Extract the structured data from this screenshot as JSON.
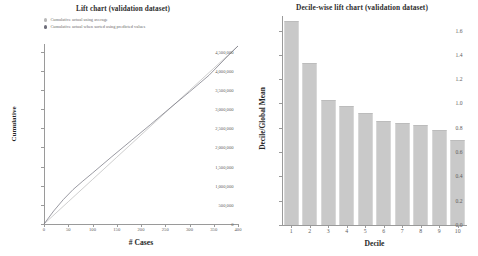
{
  "lift": {
    "title": "Lift chart (validation dataset)",
    "legend": [
      {
        "label": "Cumulative actual using average",
        "color": "#b9b9b9",
        "marker": "circle-marker"
      },
      {
        "label": "Cumulative actual when sorted using predicted values",
        "color": "#6e6e7a",
        "marker": "circle-marker"
      }
    ],
    "xlabel": "# Cases",
    "ylabel": "Cumulative",
    "xticks": [
      "0",
      "50",
      "100",
      "150",
      "200",
      "250",
      "300",
      "350",
      "400"
    ],
    "yticks": [
      "0",
      "500,000",
      "1,000,000",
      "1,500,000",
      "2,000,000",
      "2,500,000",
      "3,000,000",
      "3,500,000",
      "4,000,000",
      "4,500,000"
    ]
  },
  "decile": {
    "title": "Decile-wise lift chart (validation dataset)",
    "xlabel": "Decile",
    "ylabel": "Decile/Global Mean",
    "xticks": [
      "1",
      "2",
      "3",
      "4",
      "5",
      "6",
      "7",
      "8",
      "9",
      "10"
    ],
    "yticks": [
      "0.0",
      "0.2",
      "0.4",
      "0.6",
      "0.8",
      "1.0",
      "1.2",
      "1.4",
      "1.6"
    ]
  },
  "chart_data": [
    {
      "type": "line",
      "title": "Lift chart (validation dataset)",
      "xlabel": "# Cases",
      "ylabel": "Cumulative",
      "xlim": [
        0,
        400
      ],
      "ylim": [
        0,
        4700000
      ],
      "xticks": [
        0,
        50,
        100,
        150,
        200,
        250,
        300,
        350,
        400
      ],
      "yticks": [
        0,
        500000,
        1000000,
        1500000,
        2000000,
        2500000,
        3000000,
        3500000,
        4000000,
        4500000
      ],
      "grid": false,
      "legend_position": "top-left",
      "series": [
        {
          "name": "Cumulative actual using average",
          "color": "#b9b9b9",
          "x": [
            0,
            50,
            100,
            150,
            200,
            250,
            300,
            350,
            400
          ],
          "values": [
            0,
            581000,
            1162000,
            1743000,
            2324000,
            2905000,
            3486000,
            4067000,
            4648000
          ]
        },
        {
          "name": "Cumulative actual when sorted using predicted values",
          "color": "#6e6e7a",
          "x": [
            0,
            20,
            40,
            60,
            80,
            100,
            140,
            180,
            220,
            260,
            300,
            340,
            380,
            400
          ],
          "values": [
            0,
            340000,
            640000,
            900000,
            1120000,
            1330000,
            1760000,
            2180000,
            2600000,
            3030000,
            3450000,
            3880000,
            4400000,
            4648000
          ]
        }
      ]
    },
    {
      "type": "bar",
      "title": "Decile-wise lift chart (validation dataset)",
      "xlabel": "Decile",
      "ylabel": "Decile/Global Mean",
      "categories": [
        "1",
        "2",
        "3",
        "4",
        "5",
        "6",
        "7",
        "8",
        "9",
        "10"
      ],
      "values": [
        1.68,
        1.33,
        1.03,
        0.98,
        0.92,
        0.86,
        0.84,
        0.82,
        0.78,
        0.7
      ],
      "ylim": [
        0,
        1.72
      ],
      "yticks": [
        0.0,
        0.2,
        0.4,
        0.6,
        0.8,
        1.0,
        1.2,
        1.4,
        1.6
      ],
      "grid": false,
      "bar_color": "#c9c9c9"
    }
  ]
}
